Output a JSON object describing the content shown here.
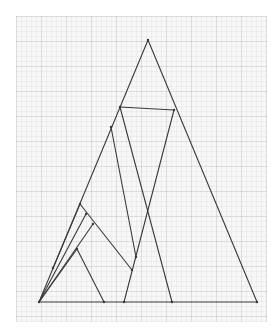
{
  "diagram": {
    "type": "geometric-construction",
    "colors": {
      "stroke": "#3a3a3a",
      "paper": "#f7f7f7",
      "grid": "#e0e0e0"
    },
    "points": {
      "A": [
        39,
        302
      ],
      "B": [
        257,
        302
      ],
      "C": [
        148,
        40
      ],
      "D": [
        120,
        107
      ],
      "E": [
        174,
        110
      ],
      "F": [
        111,
        127
      ],
      "G": [
        80,
        204
      ],
      "H": [
        86,
        214
      ],
      "I": [
        93,
        224
      ],
      "J": [
        77,
        249
      ],
      "K": [
        136,
        257
      ],
      "L": [
        132,
        270
      ],
      "M": [
        53,
        268
      ],
      "P": [
        104,
        302
      ],
      "Q": [
        124,
        302
      ],
      "R": [
        172,
        302
      ]
    },
    "segments": [
      [
        "A",
        "B"
      ],
      [
        "B",
        "C"
      ],
      [
        "C",
        "A"
      ],
      [
        "D",
        "E"
      ],
      [
        "D",
        "R"
      ],
      [
        "E",
        "Q"
      ],
      [
        "F",
        "K"
      ],
      [
        "G",
        "L"
      ],
      [
        "G",
        "M"
      ],
      [
        "H",
        "A"
      ],
      [
        "I",
        "A"
      ],
      [
        "J",
        "A"
      ],
      [
        "J",
        "P"
      ]
    ]
  }
}
